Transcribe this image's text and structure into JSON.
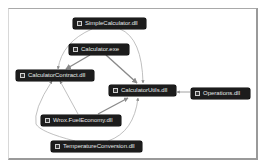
{
  "diagram": {
    "type": "dependency-graph",
    "nodes": [
      {
        "id": "simple",
        "label": "SimpleCalculator.dll",
        "icon": "assembly-icon"
      },
      {
        "id": "calcexe",
        "label": "Calculator.exe",
        "icon": "assembly-icon"
      },
      {
        "id": "contract",
        "label": "CalculatorContract.dll",
        "icon": "assembly-icon"
      },
      {
        "id": "utils",
        "label": "CalculatorUtils.dll",
        "icon": "assembly-icon"
      },
      {
        "id": "ops",
        "label": "Operations.dll",
        "icon": "assembly-icon"
      },
      {
        "id": "fuel",
        "label": "Wrox.FuelEconomy.dll",
        "icon": "assembly-icon"
      },
      {
        "id": "temp",
        "label": "TemperatureConversion.dll",
        "icon": "assembly-icon"
      }
    ],
    "edges": [
      {
        "from": "simple",
        "to": "contract"
      },
      {
        "from": "simple",
        "to": "utils"
      },
      {
        "from": "calcexe",
        "to": "contract"
      },
      {
        "from": "calcexe",
        "to": "utils"
      },
      {
        "from": "ops",
        "to": "utils"
      },
      {
        "from": "fuel",
        "to": "contract"
      },
      {
        "from": "fuel",
        "to": "utils"
      },
      {
        "from": "temp",
        "to": "contract"
      },
      {
        "from": "temp",
        "to": "utils"
      }
    ],
    "colors": {
      "node_bg": "#1c1c1c",
      "node_text": "#e8e8e8",
      "edge": "#a8a8a8",
      "edge_strong": "#8a8a8a"
    }
  }
}
